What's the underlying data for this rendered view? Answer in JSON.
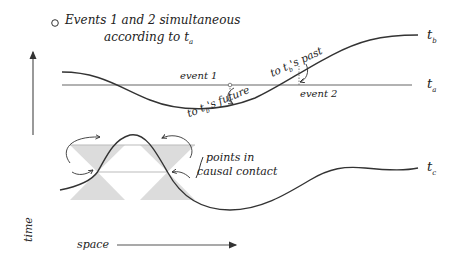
{
  "title": {
    "bullet": "○",
    "line1": "Events 1 and 2 simultaneous",
    "line2": "according to t",
    "line2_sub": "a"
  },
  "surfaces": [
    {
      "id": "t_b",
      "label": "t",
      "sub": "b"
    },
    {
      "id": "t_a",
      "label": "t",
      "sub": "a"
    },
    {
      "id": "t_c",
      "label": "t",
      "sub": "c"
    }
  ],
  "events": {
    "event1": "event 1",
    "event2": "event 2"
  },
  "annotations": {
    "future": "to t",
    "future_sub": "b",
    "future_rest": "'s future",
    "past": "to t",
    "past_sub": "b",
    "past_rest": "'s past",
    "causal_line1": "points in",
    "causal_line2": "causal contact"
  },
  "axes": {
    "time": "time",
    "space": "space"
  },
  "colors": {
    "ink": "#222222",
    "cone_fill": "#dcdcdc",
    "line_gray": "#888888"
  }
}
